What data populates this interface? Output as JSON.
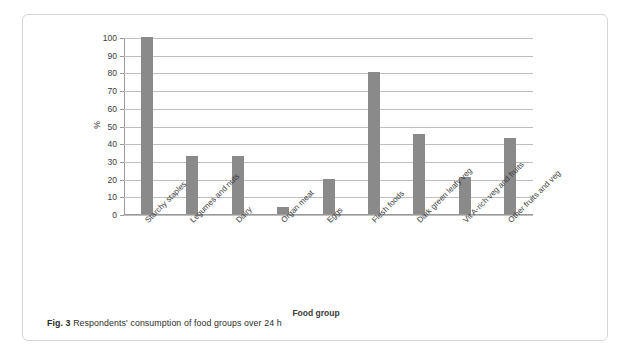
{
  "figure": {
    "caption_label": "Fig. 3",
    "caption_text": "Respondents' consumption of food groups over 24 h"
  },
  "chart_data": {
    "type": "bar",
    "title": "",
    "xlabel": "Food group",
    "ylabel": "%",
    "ylim": [
      0,
      100
    ],
    "yticks": [
      0,
      10,
      20,
      30,
      40,
      50,
      60,
      70,
      80,
      90,
      100
    ],
    "grid": true,
    "legend": "none",
    "bar_color": "#8a8a8a",
    "categories": [
      "Starchy staples",
      "Legumes and nuts",
      "Dairy",
      "Organ meat",
      "Eggs",
      "Flesh foods",
      "Dark green leafy veg",
      "Vit A-rich veg and fruits",
      "Other fruits and veg"
    ],
    "values": [
      100,
      33,
      33,
      4,
      20,
      80,
      45,
      21,
      43
    ]
  }
}
